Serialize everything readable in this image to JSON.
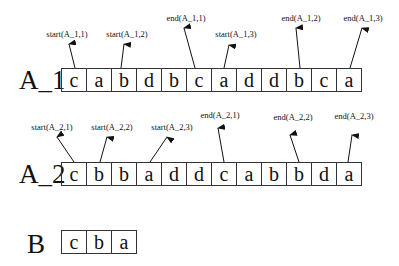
{
  "rows": {
    "A_1": {
      "label": "A_1",
      "cells": [
        "c",
        "a",
        "b",
        "d",
        "b",
        "c",
        "a",
        "d",
        "d",
        "b",
        "c",
        "a"
      ]
    },
    "A_2": {
      "label": "A_2",
      "cells": [
        "c",
        "b",
        "b",
        "a",
        "d",
        "d",
        "c",
        "a",
        "b",
        "b",
        "d",
        "a"
      ]
    },
    "B": {
      "label": "B",
      "cells": [
        "c",
        "b",
        "a"
      ]
    }
  },
  "annotations": {
    "A_1": [
      {
        "text": "start(A_1,1)",
        "cell": 0
      },
      {
        "text": "start(A_1,2)",
        "cell": 2
      },
      {
        "text": "end(A_1,1)",
        "cell": 5
      },
      {
        "text": "start(A_1,3)",
        "cell": 6
      },
      {
        "text": "end(A_1,2)",
        "cell": 9
      },
      {
        "text": "end(A_1,3)",
        "cell": 11
      }
    ],
    "A_2": [
      {
        "text": "start(A_2,1)",
        "cell": 0
      },
      {
        "text": "start(A_2,2)",
        "cell": 1
      },
      {
        "text": "start(A_2,3)",
        "cell": 3
      },
      {
        "text": "end(A_2,1)",
        "cell": 6
      },
      {
        "text": "end(A_2,2)",
        "cell": 9
      },
      {
        "text": "end(A_2,3)",
        "cell": 11
      }
    ]
  }
}
